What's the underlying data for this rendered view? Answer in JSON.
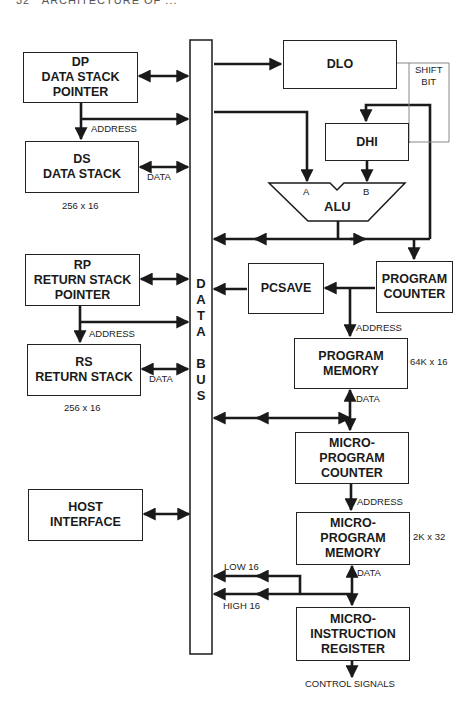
{
  "page_header": {
    "page_number": "32",
    "running_title": "ARCHITECTURE OF ..."
  },
  "data_bus": {
    "label_letters": [
      "D",
      "A",
      "T",
      "A",
      "",
      "B",
      "U",
      "S"
    ],
    "label": "DATA BUS"
  },
  "blocks": {
    "dp": {
      "lines": [
        "DP",
        "DATA STACK",
        "POINTER"
      ]
    },
    "ds": {
      "lines": [
        "DS",
        "DATA STACK"
      ],
      "size": "256 x 16"
    },
    "rp": {
      "lines": [
        "RP",
        "RETURN STACK",
        "POINTER"
      ]
    },
    "rs": {
      "lines": [
        "RS",
        "RETURN STACK"
      ],
      "size": "256 x 16"
    },
    "host": {
      "lines": [
        "HOST",
        "INTERFACE"
      ]
    },
    "dlo": {
      "lines": [
        "DLO"
      ]
    },
    "dhi": {
      "lines": [
        "DHI"
      ]
    },
    "alu": {
      "label": "ALU",
      "input_a": "A",
      "input_b": "B"
    },
    "pcsave": {
      "lines": [
        "PCSAVE"
      ]
    },
    "program_counter": {
      "lines": [
        "PROGRAM",
        "COUNTER"
      ]
    },
    "program_memory": {
      "lines": [
        "PROGRAM",
        "MEMORY"
      ],
      "size": "64K x 16"
    },
    "micro_program_counter": {
      "lines": [
        "MICRO-",
        "PROGRAM",
        "COUNTER"
      ]
    },
    "micro_program_memory": {
      "lines": [
        "MICRO-",
        "PROGRAM",
        "MEMORY"
      ],
      "size": "2K x 32"
    },
    "micro_instruction_register": {
      "lines": [
        "MICRO-",
        "INSTRUCTION",
        "REGISTER"
      ]
    }
  },
  "signals": {
    "dp_address": "ADDRESS",
    "ds_data": "DATA",
    "rp_address": "ADDRESS",
    "rs_data": "DATA",
    "shift_bit": [
      "SHIFT",
      "BIT"
    ],
    "pm_address": "ADDRESS",
    "pm_data": "DATA",
    "mpc_address": "ADDRESS",
    "mpm_data": "DATA",
    "low16": "LOW 16",
    "high16": "HIGH 16",
    "control_signals": "CONTROL SIGNALS"
  }
}
